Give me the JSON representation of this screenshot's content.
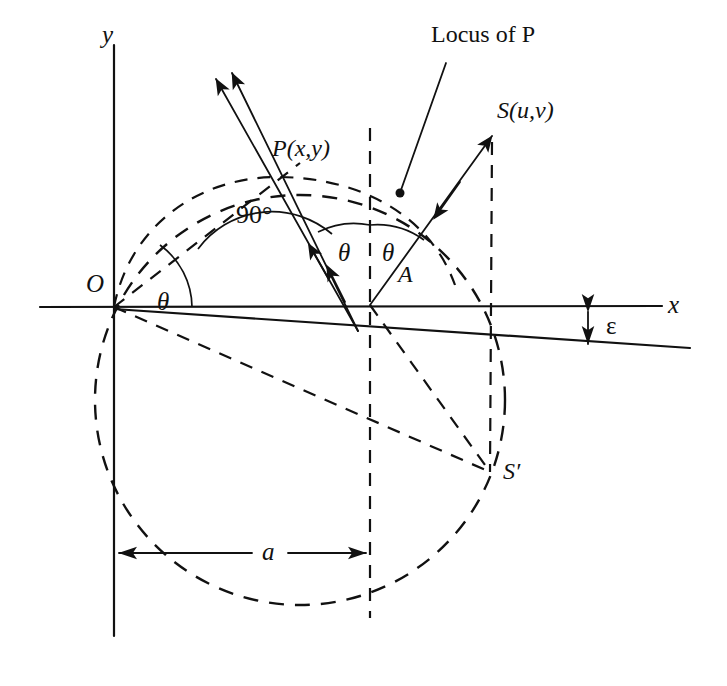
{
  "figure": {
    "background_color": "#ffffff",
    "ink_color": "#111111",
    "width": 727,
    "height": 686
  },
  "axes": {
    "x_label": "x",
    "y_label": "y",
    "origin_label": "O"
  },
  "labels": {
    "locus_of_p": "Locus of P",
    "point_p": "P(x,y)",
    "point_s": "S(u,v)",
    "point_s_prime": "S′",
    "point_a": "A",
    "right_angle": "90°",
    "theta_origin": "θ",
    "theta_left": "θ",
    "theta_right": "θ",
    "epsilon": "ε",
    "radius_a": "a"
  },
  "geometry": {
    "origin": [
      114,
      307
    ],
    "point_p": [
      278,
      178
    ],
    "point_a": [
      370,
      305
    ],
    "point_s": [
      492,
      133
    ],
    "point_s_prime": [
      490,
      472
    ],
    "locus_dot": [
      400,
      193
    ],
    "big_circle_center": [
      300,
      400
    ],
    "big_circle_radius": 205,
    "dimension_a_y": 553,
    "epsilon_x": 588
  }
}
